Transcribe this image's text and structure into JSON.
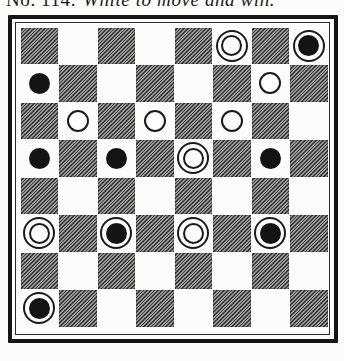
{
  "header": {
    "number": "No. 114.",
    "caption": "White to move and win."
  },
  "board": {
    "size": 8,
    "dark_square_rule": "(row + col) even",
    "colors": {
      "dark_square": "#6f6f6f",
      "hatch_line": "#3a3a3a",
      "light_square": "#fcfcfb",
      "black_piece": "#141414",
      "white_piece": "#fdfdfd",
      "frame": "#151515"
    },
    "pieces": [
      {
        "row": 0,
        "col": 5,
        "type": "white-king"
      },
      {
        "row": 0,
        "col": 7,
        "type": "black-king"
      },
      {
        "row": 1,
        "col": 0,
        "type": "black-man"
      },
      {
        "row": 1,
        "col": 6,
        "type": "white-man"
      },
      {
        "row": 2,
        "col": 1,
        "type": "white-man"
      },
      {
        "row": 2,
        "col": 3,
        "type": "white-man"
      },
      {
        "row": 2,
        "col": 5,
        "type": "white-man"
      },
      {
        "row": 3,
        "col": 0,
        "type": "black-man"
      },
      {
        "row": 3,
        "col": 2,
        "type": "black-man"
      },
      {
        "row": 3,
        "col": 4,
        "type": "white-king"
      },
      {
        "row": 3,
        "col": 6,
        "type": "black-man"
      },
      {
        "row": 5,
        "col": 0,
        "type": "white-king"
      },
      {
        "row": 5,
        "col": 2,
        "type": "black-king"
      },
      {
        "row": 5,
        "col": 4,
        "type": "white-king"
      },
      {
        "row": 5,
        "col": 6,
        "type": "black-king"
      },
      {
        "row": 7,
        "col": 0,
        "type": "black-king"
      }
    ]
  }
}
